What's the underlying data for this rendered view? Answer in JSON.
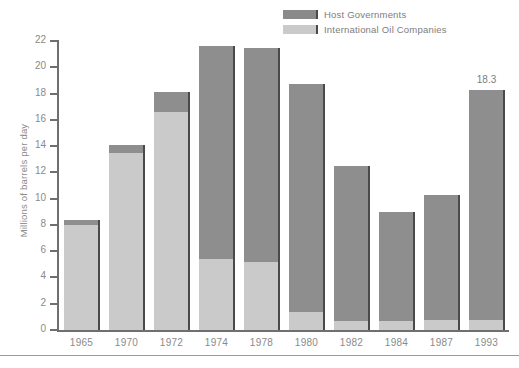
{
  "chart_data": {
    "type": "bar",
    "subtype": "stacked",
    "title": "",
    "xlabel": "",
    "ylabel": "Millions of barrels per day",
    "ylim": [
      0,
      22
    ],
    "ytick_step": 2,
    "yticks": [
      0,
      2,
      4,
      6,
      8,
      10,
      12,
      14,
      16,
      18,
      20,
      22
    ],
    "ytick_labels": [
      "0",
      "2",
      "4",
      "6",
      "8",
      "10",
      "12",
      "14",
      "16",
      "18",
      "20",
      "22"
    ],
    "grid": false,
    "legend_position": "top-right",
    "categories": [
      "1965",
      "1970",
      "1972",
      "1974",
      "1978",
      "1980",
      "1982",
      "1984",
      "1987",
      "1993"
    ],
    "series": [
      {
        "name": "International Oil Companies",
        "color": "#cacaca",
        "values": [
          8.0,
          13.5,
          16.6,
          5.4,
          5.2,
          1.4,
          0.65,
          0.7,
          0.8,
          0.8
        ]
      },
      {
        "name": "Host Governments",
        "color": "#8e8e8e",
        "values": [
          0.4,
          0.6,
          1.5,
          16.2,
          16.3,
          17.3,
          11.85,
          8.3,
          9.5,
          17.5
        ]
      }
    ],
    "totals": [
      8.4,
      14.1,
      18.1,
      21.6,
      21.5,
      18.7,
      12.5,
      9.0,
      10.3,
      18.3
    ],
    "annotations": [
      {
        "category": "1993",
        "text": "18.3",
        "position": "above-bar"
      }
    ]
  },
  "legend": {
    "items": [
      {
        "label": "Host Governments",
        "swatch": "dark"
      },
      {
        "label": "International Oil Companies",
        "swatch": "light"
      }
    ]
  },
  "colors": {
    "host_governments": "#8e8e8e",
    "international_oil_companies": "#cacaca",
    "axis": "#6f6f6f",
    "text": "#8a8a8a",
    "background": "#ffffff"
  },
  "footer": {
    "rule": true,
    "cut_off_text": ""
  }
}
